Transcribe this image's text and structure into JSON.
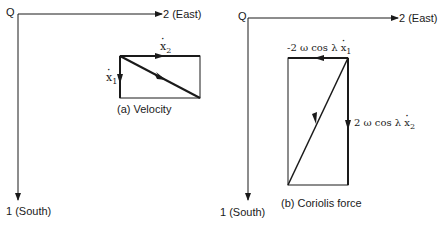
{
  "panel_a": {
    "origin_label": "Q",
    "x_axis_label": "2 (East)",
    "y_axis_label": "1 (South)",
    "caption": "(a)  Velocity",
    "vectors": {
      "x2_label": "x",
      "x2_sub": "2",
      "x1_label": "x",
      "x1_sub": "1"
    }
  },
  "panel_b": {
    "origin_label": "Q",
    "x_axis_label": "2 (East)",
    "y_axis_label": "1 (South)",
    "caption": "(b)  Coriolis force",
    "vectors": {
      "top_label": "-2 ω cos λ ",
      "top_var": "x",
      "top_sub": "1",
      "right_label": "2 ω cos λ ",
      "right_var": "x",
      "right_sub": "2"
    }
  },
  "colors": {
    "line": "#1a1a1a",
    "background": "#ffffff"
  }
}
